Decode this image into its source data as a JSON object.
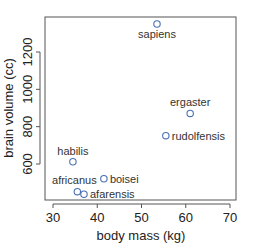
{
  "chart_data": {
    "type": "scatter",
    "title": "",
    "xlabel": "body mass (kg)",
    "ylabel": "brain volume (cc)",
    "xlim": [
      28.5,
      71.5
    ],
    "ylim": [
      409,
      1379
    ],
    "xticks": [
      30,
      40,
      50,
      60,
      70
    ],
    "yticks": [
      600,
      800,
      1000,
      1200
    ],
    "grid": false,
    "legend": null,
    "marker": "open-circle",
    "marker_color": "#4a6fb5",
    "points": [
      {
        "label": "afarensis",
        "x": 37.0,
        "y": 438,
        "label_pos": "right"
      },
      {
        "label": "africanus",
        "x": 35.5,
        "y": 452,
        "label_pos": "top"
      },
      {
        "label": "habilis",
        "x": 34.5,
        "y": 612,
        "label_pos": "top"
      },
      {
        "label": "boisei",
        "x": 41.5,
        "y": 521,
        "label_pos": "right"
      },
      {
        "label": "rudolfensis",
        "x": 55.5,
        "y": 752,
        "label_pos": "right"
      },
      {
        "label": "ergaster",
        "x": 61.0,
        "y": 871,
        "label_pos": "top"
      },
      {
        "label": "sapiens",
        "x": 53.5,
        "y": 1350,
        "label_pos": "bottom"
      }
    ]
  }
}
